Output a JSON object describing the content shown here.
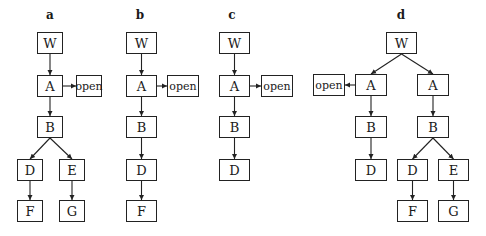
{
  "diagram": {
    "panels": [
      {
        "id": "a",
        "label": "a",
        "label_x": 50,
        "label_y": 8,
        "nodes": [
          {
            "id": "a-W",
            "text": "W",
            "x": 37,
            "y": 32,
            "w": 26,
            "h": 22
          },
          {
            "id": "a-A",
            "text": "A",
            "x": 37,
            "y": 75,
            "w": 26,
            "h": 22
          },
          {
            "id": "a-open",
            "text": "open",
            "x": 76,
            "y": 75,
            "w": 26,
            "h": 22,
            "small": true
          },
          {
            "id": "a-B",
            "text": "B",
            "x": 37,
            "y": 116,
            "w": 26,
            "h": 22
          },
          {
            "id": "a-D",
            "text": "D",
            "x": 17,
            "y": 159,
            "w": 26,
            "h": 22
          },
          {
            "id": "a-E",
            "text": "E",
            "x": 59,
            "y": 159,
            "w": 26,
            "h": 22
          },
          {
            "id": "a-F",
            "text": "F",
            "x": 17,
            "y": 200,
            "w": 26,
            "h": 22
          },
          {
            "id": "a-G",
            "text": "G",
            "x": 59,
            "y": 200,
            "w": 26,
            "h": 22
          }
        ],
        "edges": [
          [
            "a-W",
            "a-A"
          ],
          [
            "a-A",
            "a-open"
          ],
          [
            "a-A",
            "a-B"
          ],
          [
            "a-B",
            "a-D"
          ],
          [
            "a-B",
            "a-E"
          ],
          [
            "a-D",
            "a-F"
          ],
          [
            "a-E",
            "a-G"
          ]
        ]
      },
      {
        "id": "b",
        "label": "b",
        "label_x": 140,
        "label_y": 8,
        "nodes": [
          {
            "id": "b-W",
            "text": "W",
            "x": 126,
            "y": 32,
            "w": 31,
            "h": 22
          },
          {
            "id": "b-A",
            "text": "A",
            "x": 126,
            "y": 75,
            "w": 31,
            "h": 22
          },
          {
            "id": "b-open",
            "text": "open",
            "x": 167,
            "y": 75,
            "w": 32,
            "h": 22,
            "small": true
          },
          {
            "id": "b-B",
            "text": "B",
            "x": 126,
            "y": 116,
            "w": 31,
            "h": 22
          },
          {
            "id": "b-D",
            "text": "D",
            "x": 126,
            "y": 159,
            "w": 31,
            "h": 22
          },
          {
            "id": "b-F",
            "text": "F",
            "x": 126,
            "y": 200,
            "w": 31,
            "h": 22
          }
        ],
        "edges": [
          [
            "b-W",
            "b-A"
          ],
          [
            "b-A",
            "b-open"
          ],
          [
            "b-A",
            "b-B"
          ],
          [
            "b-B",
            "b-D"
          ],
          [
            "b-D",
            "b-F"
          ]
        ]
      },
      {
        "id": "c",
        "label": "c",
        "label_x": 232,
        "label_y": 8,
        "nodes": [
          {
            "id": "c-W",
            "text": "W",
            "x": 219,
            "y": 32,
            "w": 31,
            "h": 22
          },
          {
            "id": "c-A",
            "text": "A",
            "x": 219,
            "y": 75,
            "w": 31,
            "h": 22
          },
          {
            "id": "c-open",
            "text": "open",
            "x": 261,
            "y": 75,
            "w": 32,
            "h": 22,
            "small": true
          },
          {
            "id": "c-B",
            "text": "B",
            "x": 219,
            "y": 116,
            "w": 31,
            "h": 22
          },
          {
            "id": "c-D",
            "text": "D",
            "x": 219,
            "y": 159,
            "w": 31,
            "h": 22
          }
        ],
        "edges": [
          [
            "c-W",
            "c-A"
          ],
          [
            "c-A",
            "c-open"
          ],
          [
            "c-A",
            "c-B"
          ],
          [
            "c-B",
            "c-D"
          ]
        ]
      },
      {
        "id": "d",
        "label": "d",
        "label_x": 401,
        "label_y": 8,
        "nodes": [
          {
            "id": "d-W",
            "text": "W",
            "x": 386,
            "y": 32,
            "w": 31,
            "h": 22
          },
          {
            "id": "d-open",
            "text": "open",
            "x": 313,
            "y": 74,
            "w": 32,
            "h": 22,
            "small": true
          },
          {
            "id": "d-A1",
            "text": "A",
            "x": 355,
            "y": 74,
            "w": 32,
            "h": 22
          },
          {
            "id": "d-A2",
            "text": "A",
            "x": 417,
            "y": 74,
            "w": 32,
            "h": 22
          },
          {
            "id": "d-B1",
            "text": "B",
            "x": 355,
            "y": 116,
            "w": 32,
            "h": 22
          },
          {
            "id": "d-B2",
            "text": "B",
            "x": 417,
            "y": 116,
            "w": 32,
            "h": 22
          },
          {
            "id": "d-D1",
            "text": "D",
            "x": 355,
            "y": 159,
            "w": 32,
            "h": 22
          },
          {
            "id": "d-D2",
            "text": "D",
            "x": 397,
            "y": 159,
            "w": 31,
            "h": 22
          },
          {
            "id": "d-E",
            "text": "E",
            "x": 438,
            "y": 159,
            "w": 31,
            "h": 22
          },
          {
            "id": "d-F",
            "text": "F",
            "x": 397,
            "y": 200,
            "w": 31,
            "h": 22
          },
          {
            "id": "d-G",
            "text": "G",
            "x": 438,
            "y": 200,
            "w": 31,
            "h": 22
          }
        ],
        "edges": [
          [
            "d-W",
            "d-A1"
          ],
          [
            "d-W",
            "d-A2"
          ],
          [
            "d-A1",
            "d-open"
          ],
          [
            "d-A1",
            "d-B1"
          ],
          [
            "d-B1",
            "d-D1"
          ],
          [
            "d-A2",
            "d-B2"
          ],
          [
            "d-B2",
            "d-D2"
          ],
          [
            "d-B2",
            "d-E"
          ],
          [
            "d-D2",
            "d-F"
          ],
          [
            "d-E",
            "d-G"
          ]
        ]
      }
    ]
  }
}
